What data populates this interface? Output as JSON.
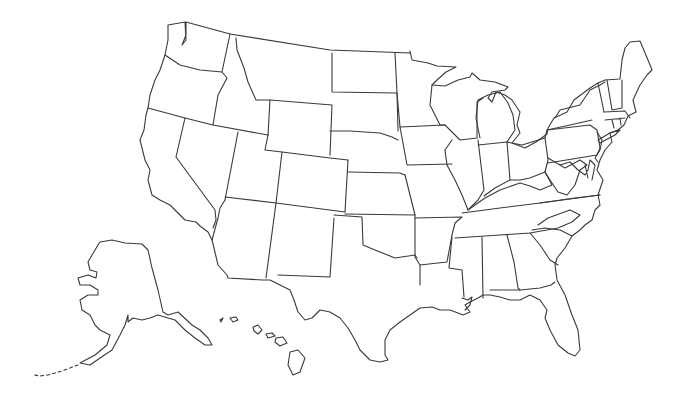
{
  "map": {
    "title": "United States blank outline map",
    "type": "outline",
    "labels_visible": false,
    "stroke_color": "#3a3a3a",
    "fill_color": "#ffffff",
    "background_color": "#ffffff",
    "regions": [
      "Contiguous United States",
      "Alaska",
      "Hawaii"
    ]
  }
}
